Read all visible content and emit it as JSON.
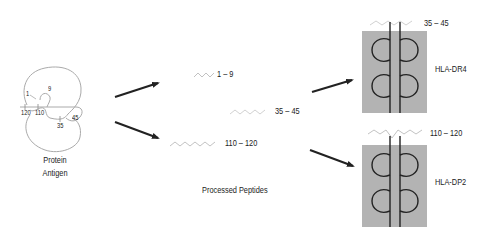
{
  "protein": {
    "label_line1": "Protein",
    "label_line2": "Antigen",
    "residue_labels": [
      "1",
      "9",
      "120",
      "110",
      "35",
      "45"
    ]
  },
  "processed": {
    "label": "Processed Peptides",
    "peptides": [
      {
        "range": "1 – 9"
      },
      {
        "range": "35 – 45"
      },
      {
        "range": "110 – 120"
      }
    ]
  },
  "mhc": [
    {
      "name": "HLA-DR4",
      "bound_peptide": "35 – 45"
    },
    {
      "name": "HLA-DP2",
      "bound_peptide": "110 – 120"
    }
  ],
  "colors": {
    "mhc_box": "#b3b3b3",
    "line": "#222222",
    "peptide": "#bbbbbb",
    "protein_outline": "#aaaaaa"
  }
}
